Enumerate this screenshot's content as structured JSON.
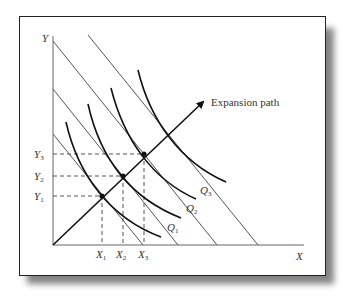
{
  "diagram": {
    "type": "isoquant-isocost expansion path",
    "axes": {
      "y_label": "Y",
      "x_label": "X"
    },
    "isoquants": [
      {
        "label": "",
        "path": "M66,122 C78,175 110,218 161,237"
      },
      {
        "label": "Q",
        "sub": "1",
        "path": "M88,104 C100,158 130,198 181,218"
      },
      {
        "label": "Q",
        "sub": "2",
        "path": "M111,88 C124,140 153,180 196,199"
      },
      {
        "label": "Q",
        "sub": "3",
        "path": "M138,70 C150,120 180,162 226,182"
      }
    ],
    "isocost_lines": [
      {
        "x1": 53,
        "y1": 134,
        "x2": 143,
        "y2": 245
      },
      {
        "x1": 53,
        "y1": 89,
        "x2": 178,
        "y2": 245
      },
      {
        "x1": 53,
        "y1": 41,
        "x2": 217,
        "y2": 245
      },
      {
        "x1": 88,
        "y1": 35,
        "x2": 258,
        "y2": 245
      }
    ],
    "equilibrium_points": [
      {
        "x": 102,
        "y": 196,
        "x_label": "X",
        "x_sub": "1",
        "y_label": "Y",
        "y_sub": "1"
      },
      {
        "x": 123,
        "y": 176,
        "x_label": "X",
        "x_sub": "2",
        "y_label": "Y",
        "y_sub": "2"
      },
      {
        "x": 144,
        "y": 154,
        "x_label": "X",
        "x_sub": "3",
        "y_label": "Y",
        "y_sub": "3"
      }
    ],
    "expansion_path": {
      "label": "Expansion path",
      "from": {
        "x": 53,
        "y": 245
      },
      "to": {
        "x": 204,
        "y": 101
      }
    },
    "colors": {
      "curve": "#111111",
      "line": "#555555",
      "dashed": "#555555",
      "text": "#333333"
    }
  }
}
